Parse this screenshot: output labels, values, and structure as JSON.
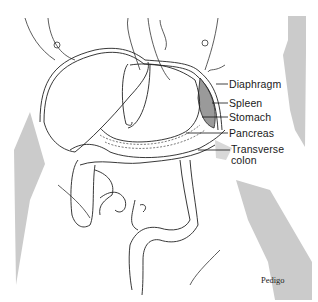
{
  "figure": {
    "labels": [
      {
        "id": "diaphragm",
        "text": "Diaphragm"
      },
      {
        "id": "spleen",
        "text": "Spleen"
      },
      {
        "id": "stomach",
        "text": "Stomach"
      },
      {
        "id": "pancreas",
        "text": "Pancreas"
      },
      {
        "id": "transverse-colon",
        "text": "Transverse",
        "text2": "colon"
      }
    ],
    "credit": "Pedigo",
    "colors": {
      "ink": "#1a1a1a",
      "shadow": "#c8c8c8",
      "spleen_fill": "#9a9a9a"
    }
  }
}
